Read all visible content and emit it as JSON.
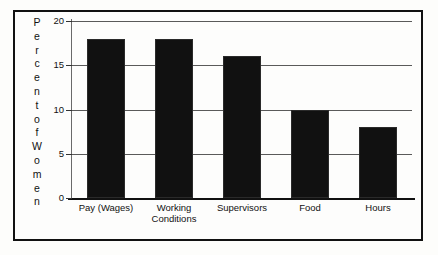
{
  "chart_data": {
    "type": "bar",
    "title": "",
    "xlabel": "",
    "ylabel": "Percent of Women",
    "ylabel_stacked": [
      "P",
      "e",
      "r",
      "c",
      "e",
      "n",
      "t",
      "o",
      "f",
      "W",
      "o",
      "m",
      "e",
      "n"
    ],
    "categories": [
      "Pay (Wages)",
      "Working Conditions",
      "Supervisors",
      "Food",
      "Hours"
    ],
    "category_lines": [
      [
        "Pay (Wages)"
      ],
      [
        "Working",
        "Conditions"
      ],
      [
        "Supervisors"
      ],
      [
        "Food"
      ],
      [
        "Hours"
      ]
    ],
    "values": [
      18,
      18,
      16,
      10,
      8
    ],
    "ylim": [
      0,
      20
    ],
    "yticks": [
      0,
      5,
      10,
      15,
      20
    ],
    "ytick_labels": [
      "0",
      "5",
      "10",
      "15",
      "20"
    ],
    "grid": true,
    "legend": "none",
    "colors": {
      "bar": "#111111",
      "gridline": "#5a5a5a",
      "axis": "#111111",
      "frame": "#111111",
      "background": "#fdfdfc",
      "text": "#111111"
    }
  }
}
